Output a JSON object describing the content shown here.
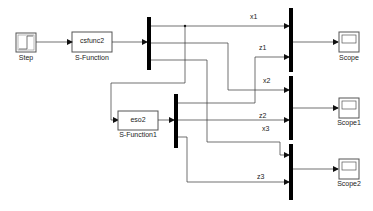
{
  "model": {
    "blocks": {
      "step": {
        "label": "Step"
      },
      "sfunction": {
        "label": "S-Function",
        "text": "csfunc2"
      },
      "sfunction1": {
        "label": "S-Function1",
        "text": "eso2"
      },
      "scope": {
        "label": "Scope"
      },
      "scope1": {
        "label": "Scope1"
      },
      "scope2": {
        "label": "Scope2"
      }
    },
    "signals": {
      "x1": "x1",
      "z1": "z1",
      "x2": "x2",
      "z2": "z2",
      "x3": "x3",
      "z3": "z3"
    },
    "colors": {
      "line": "#333333",
      "bar": "#000000",
      "block_border": "#555555",
      "block_fill": "#ffffff"
    }
  }
}
